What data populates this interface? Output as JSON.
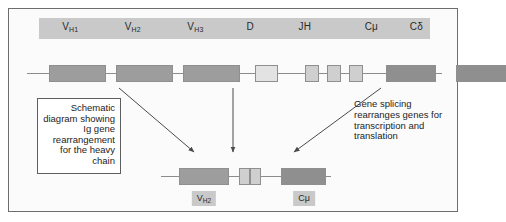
{
  "figure": {
    "title_note_left": "Schematic diagram showing Ig gene rearrangement for the heavy chain",
    "note_right": "Gene splicing rearranges genes for transcription and translation",
    "frame_color": "#6d6d6d",
    "background_color": "#fbfbfb"
  },
  "label_bar": {
    "background_color": "#c9c9c9",
    "segments": [
      {
        "name": "VH1",
        "text": "V",
        "sub": "H1",
        "x_percent": 8
      },
      {
        "name": "VH2",
        "text": "V",
        "sub": "H2",
        "x_percent": 24
      },
      {
        "name": "VH3",
        "text": "V",
        "sub": "H3",
        "x_percent": 40
      },
      {
        "name": "D",
        "text": "D",
        "sub": "",
        "x_percent": 54
      },
      {
        "name": "JH",
        "text": "JH",
        "sub": "",
        "x_percent": 68
      },
      {
        "name": "Cmu",
        "text": "Cμ",
        "sub": "",
        "x_percent": 85
      },
      {
        "name": "Cdelta",
        "text": "Cδ",
        "sub": "",
        "x_percent": 96.5
      }
    ]
  },
  "germline_locus": {
    "line_color": "#8c8c8c",
    "boxes": [
      {
        "name": "vh1-box",
        "left": 22,
        "width": 57,
        "top": 2,
        "height": 17,
        "fill": "#9d9d9d"
      },
      {
        "name": "vh2-box",
        "left": 89,
        "width": 57,
        "top": 2,
        "height": 17,
        "fill": "#9d9d9d"
      },
      {
        "name": "vh3-box",
        "left": 156,
        "width": 57,
        "top": 2,
        "height": 17,
        "fill": "#9d9d9d"
      },
      {
        "name": "d-box",
        "left": 228,
        "width": 23,
        "top": 2,
        "height": 17,
        "fill": "#e3e3e3"
      },
      {
        "name": "jh1-box",
        "left": 278,
        "width": 14,
        "top": 2,
        "height": 17,
        "fill": "#cfcfcf"
      },
      {
        "name": "jh2-box",
        "left": 300,
        "width": 14,
        "top": 2,
        "height": 17,
        "fill": "#cfcfcf"
      },
      {
        "name": "jh3-box",
        "left": 322,
        "width": 14,
        "top": 2,
        "height": 17,
        "fill": "#cfcfcf"
      },
      {
        "name": "cmu-box",
        "left": 359,
        "width": 50,
        "top": 2,
        "height": 17,
        "fill": "#8f8f8f"
      },
      {
        "name": "cdelta-box",
        "left": 429,
        "width": 50,
        "top": 2,
        "height": 17,
        "fill": "#8f8f8f"
      }
    ]
  },
  "rearranged_locus": {
    "line_color": "#8c8c8c",
    "boxes": [
      {
        "name": "vh2-box-rearranged",
        "left": 18,
        "width": 50,
        "top": 2,
        "height": 17,
        "fill": "#9d9d9d"
      },
      {
        "name": "d-box-rearranged",
        "left": 78,
        "width": 11,
        "top": 2,
        "height": 17,
        "fill": "#cfcfcf"
      },
      {
        "name": "jh-box-rearranged",
        "left": 89,
        "width": 11,
        "top": 2,
        "height": 17,
        "fill": "#cfcfcf"
      },
      {
        "name": "cmu-box-rearranged",
        "left": 120,
        "width": 45,
        "top": 2,
        "height": 17,
        "fill": "#8f8f8f"
      }
    ],
    "chips": [
      {
        "name": "vh2-chip",
        "text": "V",
        "sub": "H2",
        "x": 43
      },
      {
        "name": "cmu-chip",
        "text": "Cμ",
        "sub": "",
        "x": 143
      }
    ]
  },
  "arrows": {
    "color": "#4a4a4a",
    "items": [
      {
        "name": "arrow-vh2-to-rearranged",
        "x1": 110,
        "y1": 79,
        "x2": 185,
        "y2": 143
      },
      {
        "name": "arrow-jh-to-rearranged",
        "x1": 224,
        "y1": 79,
        "x2": 224,
        "y2": 143
      },
      {
        "name": "arrow-cmu-to-rearranged",
        "x1": 372,
        "y1": 79,
        "x2": 285,
        "y2": 143
      }
    ]
  }
}
